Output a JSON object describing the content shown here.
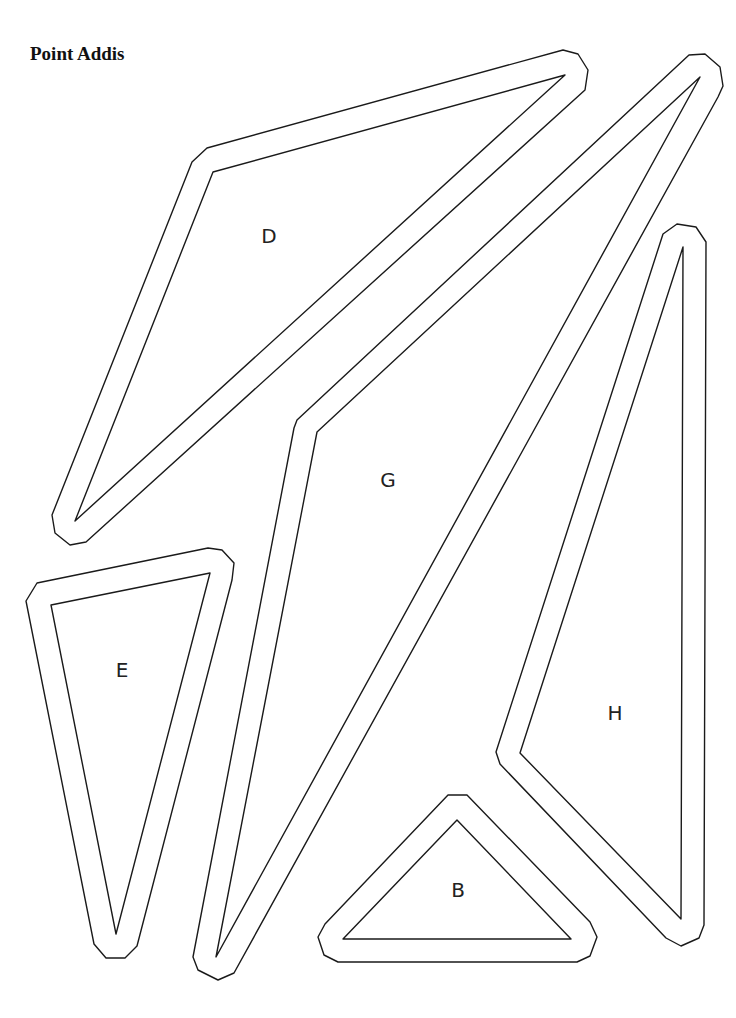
{
  "title": "Point Addis",
  "pieces": [
    {
      "label": "D",
      "label_pos": [
        269,
        237
      ],
      "outer": "192,162 207,148 563,50 578,54 588,70 585,90 86,542 70,545 55,533 52,515",
      "inner": "213,172 565,75 75,521"
    },
    {
      "label": "G",
      "label_pos": [
        388,
        481
      ],
      "outer": "297,420 689,55 705,54 720,67 723,86 718,97 234,973 218,980 198,970 193,957 294,428",
      "inner": "317,432 700,77 216,957"
    },
    {
      "label": "H",
      "label_pos": [
        615,
        714
      ],
      "outer": "663,234 677,224 696,227 706,242 704,925 699,938 681,946 666,938 500,764 496,752",
      "inner": "683,247 681,919 520,753"
    },
    {
      "label": "E",
      "label_pos": [
        122,
        671
      ],
      "outer": "26,601 37,583 208,548 222,550 234,563 232,580 137,946 125,958 106,958 94,944",
      "inner": "51,605 210,573 116,934"
    },
    {
      "label": "B",
      "label_pos": [
        458,
        891
      ],
      "outer": "448,795 467,795 590,922 597,937 590,956 577,962 338,962 324,955 318,937 325,924",
      "inner": "457,820 571,939 343,939"
    }
  ]
}
